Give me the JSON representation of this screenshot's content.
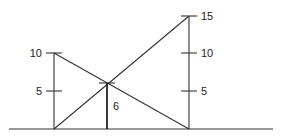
{
  "diagram": {
    "left_pole": {
      "height": 10,
      "ticks": [
        {
          "label": "5",
          "value": 5
        },
        {
          "label": "10",
          "value": 10
        }
      ]
    },
    "right_pole": {
      "height": 15,
      "ticks": [
        {
          "label": "5",
          "value": 5
        },
        {
          "label": "10",
          "value": 10
        },
        {
          "label": "15",
          "value": 15
        }
      ]
    },
    "intersection": {
      "height_label": "6",
      "height": 6
    },
    "colors": {
      "line": "#333333",
      "background": "#ffffff"
    }
  }
}
